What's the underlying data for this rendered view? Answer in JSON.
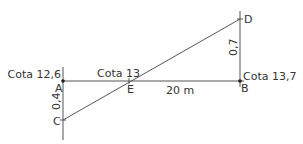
{
  "diagram": {
    "line_color": "#555555",
    "text_color": "#333333",
    "points": {
      "A": {
        "label": "A",
        "x": 63,
        "y": 81
      },
      "B": {
        "label": "B",
        "x": 240,
        "y": 81
      },
      "C": {
        "label": "C",
        "x": 63,
        "y": 120
      },
      "D": {
        "label": "D",
        "x": 240,
        "y": 19
      },
      "E": {
        "label": "E",
        "x": 129,
        "y": 81
      }
    },
    "labels": {
      "cota_a": "Cota 12,6",
      "cota_e": "Cota 13",
      "cota_b": "Cota 13,7",
      "distance_ab": "20 m",
      "height_ac": "0,4",
      "height_bd": "0,7"
    }
  }
}
